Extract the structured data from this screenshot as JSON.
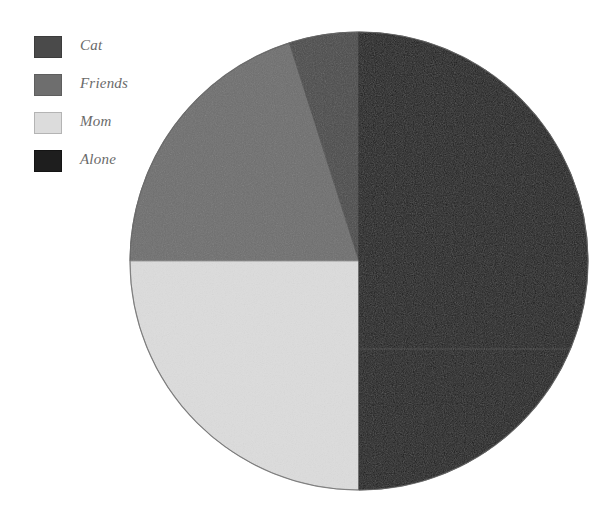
{
  "chart_data": {
    "type": "pie",
    "title": "",
    "categories": [
      "Cat",
      "Friends",
      "Mom",
      "Alone"
    ],
    "values": [
      5,
      20,
      25,
      50
    ],
    "units": "percent",
    "angles_deg": [
      17.7,
      72.3,
      90,
      180
    ],
    "colors": [
      "#4a4a4a",
      "#6e6e6e",
      "#dcdcdc",
      "#1c1c1c"
    ],
    "start_angle_deg": 0,
    "direction": "counterclockwise",
    "legend_position": "top-left",
    "grid": false,
    "xlabel": "",
    "ylabel": ""
  },
  "legend": {
    "items": [
      {
        "label": "Cat",
        "color": "#4a4a4a",
        "border": "#3c3c3c"
      },
      {
        "label": "Friends",
        "color": "#6e6e6e",
        "border": "#5e5e5e"
      },
      {
        "label": "Mom",
        "color": "#dcdcdc",
        "border": "#b4b4b4"
      },
      {
        "label": "Alone",
        "color": "#1e1e1e",
        "border": "#141414"
      }
    ]
  },
  "pie": {
    "center_x": 359,
    "center_y": 261,
    "radius": 229,
    "outline_color": "#6f6f6f",
    "slices": [
      {
        "name": "Cat",
        "color": "#4a4a4a",
        "path": "M 359 261 L 359 32 A 229 229 0 0 0 289.35 42.87 Z"
      },
      {
        "name": "Friends",
        "color": "#6e6e6e",
        "path": "M 359 261 L 289.35 42.87 A 229 229 0 0 0 130 261 Z"
      },
      {
        "name": "Mom",
        "color": "#dcdcdc",
        "path": "M 359 261 L 130 261 A 229 229 0 0 0 359 490 Z"
      },
      {
        "name": "Alone",
        "color": "#1c1c1c",
        "path": "M 359 261 L 359 490 A 229 229 0 0 0 359 32 Z"
      }
    ]
  }
}
